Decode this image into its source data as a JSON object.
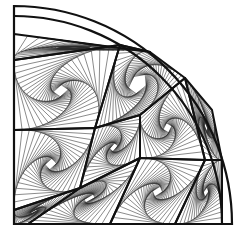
{
  "artwork": {
    "subject": "quarter-circle pursuit-curve line drawing",
    "stroke_color": "#111111",
    "background": "#ffffff",
    "center": [
      14,
      224
    ],
    "outer_radius": 218,
    "inner_radius": 208,
    "steps": 22,
    "ratio": 0.1,
    "cells": [
      {
        "pts": [
          [
            14,
            60
          ],
          [
            14,
            130
          ],
          [
            95,
            128
          ],
          [
            120,
            45
          ]
        ],
        "dir": 1
      },
      {
        "pts": [
          [
            14,
            130
          ],
          [
            14,
            210
          ],
          [
            80,
            188
          ],
          [
            95,
            128
          ]
        ],
        "dir": -1
      },
      {
        "pts": [
          [
            120,
            45
          ],
          [
            95,
            128
          ],
          [
            140,
            115
          ],
          [
            185,
            78
          ],
          [
            150,
            52
          ]
        ],
        "dir": 1
      },
      {
        "pts": [
          [
            95,
            128
          ],
          [
            80,
            188
          ],
          [
            140,
            158
          ],
          [
            140,
            115
          ]
        ],
        "dir": -1
      },
      {
        "pts": [
          [
            14,
            210
          ],
          [
            14,
            224
          ],
          [
            28,
            224
          ],
          [
            80,
            188
          ]
        ],
        "dir": 1
      },
      {
        "pts": [
          [
            80,
            188
          ],
          [
            28,
            224
          ],
          [
            110,
            224
          ],
          [
            140,
            158
          ]
        ],
        "dir": -1
      },
      {
        "pts": [
          [
            140,
            115
          ],
          [
            140,
            158
          ],
          [
            205,
            160
          ],
          [
            185,
            78
          ]
        ],
        "dir": 1
      },
      {
        "pts": [
          [
            140,
            158
          ],
          [
            110,
            224
          ],
          [
            175,
            224
          ],
          [
            205,
            160
          ]
        ],
        "dir": -1
      },
      {
        "pts": [
          [
            205,
            160
          ],
          [
            175,
            224
          ],
          [
            222,
            224
          ],
          [
            222,
            160
          ]
        ],
        "dir": 1
      },
      {
        "pts": [
          [
            14,
            60
          ],
          [
            120,
            45
          ],
          [
            150,
            52
          ],
          [
            14,
            34
          ]
        ],
        "dir": -1
      },
      {
        "pts": [
          [
            185,
            78
          ],
          [
            205,
            160
          ],
          [
            222,
            160
          ],
          [
            212,
            110
          ]
        ],
        "dir": -1
      }
    ]
  }
}
